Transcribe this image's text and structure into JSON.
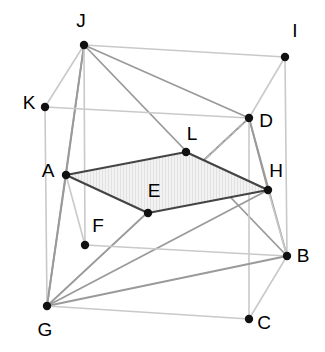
{
  "figure": {
    "type": "geometry-diagram",
    "background_color": "#ffffff",
    "colors": {
      "vertex_dot": "#111111",
      "label_text": "#000000",
      "edge_light": "#c9c9c9",
      "edge_medium": "#9a9a9a",
      "edge_dark": "#555555",
      "section_outline": "#444444",
      "section_fill": "#efefef",
      "dashed_edge": "#b5b5b5"
    },
    "points": [
      {
        "id": "A",
        "label": "A",
        "x": 66,
        "y": 175,
        "label_x": 48,
        "label_y": 172
      },
      {
        "id": "B",
        "label": "B",
        "x": 287,
        "y": 256,
        "label_x": 303,
        "label_y": 257
      },
      {
        "id": "C",
        "label": "C",
        "x": 249,
        "y": 319,
        "label_x": 264,
        "label_y": 324
      },
      {
        "id": "D",
        "label": "D",
        "x": 249,
        "y": 118,
        "label_x": 266,
        "label_y": 122
      },
      {
        "id": "E",
        "label": "E",
        "x": 148,
        "y": 213,
        "label_x": 154,
        "label_y": 192
      },
      {
        "id": "F",
        "label": "F",
        "x": 85,
        "y": 245,
        "label_x": 98,
        "label_y": 227
      },
      {
        "id": "G",
        "label": "G",
        "x": 47,
        "y": 306,
        "label_x": 45,
        "label_y": 331
      },
      {
        "id": "H",
        "label": "H",
        "x": 268,
        "y": 190,
        "label_x": 276,
        "label_y": 172
      },
      {
        "id": "I",
        "label": "I",
        "x": 285,
        "y": 57,
        "label_x": 295,
        "label_y": 32
      },
      {
        "id": "J",
        "label": "J",
        "x": 84,
        "y": 45,
        "label_x": 81,
        "label_y": 22
      },
      {
        "id": "K",
        "label": "K",
        "x": 45,
        "y": 107,
        "label_x": 29,
        "label_y": 104
      },
      {
        "id": "L",
        "label": "L",
        "x": 186,
        "y": 152,
        "label_x": 192,
        "label_y": 135
      }
    ],
    "edges": [
      {
        "from": "J",
        "to": "I",
        "style": "light"
      },
      {
        "from": "J",
        "to": "K",
        "style": "light"
      },
      {
        "from": "J",
        "to": "D",
        "style": "medium"
      },
      {
        "from": "J",
        "to": "B",
        "style": "medium"
      },
      {
        "from": "J",
        "to": "A",
        "style": "medium"
      },
      {
        "from": "J",
        "to": "G",
        "style": "medium"
      },
      {
        "from": "J",
        "to": "F",
        "style": "light"
      },
      {
        "from": "K",
        "to": "D",
        "style": "light"
      },
      {
        "from": "K",
        "to": "G",
        "style": "light"
      },
      {
        "from": "I",
        "to": "D",
        "style": "light"
      },
      {
        "from": "I",
        "to": "B",
        "style": "light"
      },
      {
        "from": "D",
        "to": "H",
        "style": "medium"
      },
      {
        "from": "D",
        "to": "B",
        "style": "medium"
      },
      {
        "from": "D",
        "to": "G",
        "style": "medium"
      },
      {
        "from": "D",
        "to": "C",
        "style": "light"
      },
      {
        "from": "D",
        "to": "E",
        "style": "dashed"
      },
      {
        "from": "H",
        "to": "B",
        "style": "light"
      },
      {
        "from": "H",
        "to": "G",
        "style": "medium"
      },
      {
        "from": "A",
        "to": "G",
        "style": "medium"
      },
      {
        "from": "A",
        "to": "F",
        "style": "light"
      },
      {
        "from": "F",
        "to": "B",
        "style": "light"
      },
      {
        "from": "G",
        "to": "B",
        "style": "medium"
      },
      {
        "from": "G",
        "to": "C",
        "style": "light"
      },
      {
        "from": "C",
        "to": "B",
        "style": "light"
      }
    ],
    "shaded_section": {
      "name": "quadrilateral-ALHE",
      "vertices": [
        "A",
        "L",
        "H",
        "E"
      ]
    }
  }
}
